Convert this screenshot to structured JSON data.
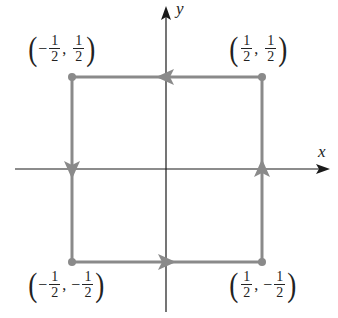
{
  "diagram": {
    "type": "square-contour",
    "axes": {
      "x_label": "x",
      "y_label": "y",
      "color": "#1a1a1a"
    },
    "path": {
      "color": "#8a8a8a",
      "direction": "counterclockwise",
      "arrows": [
        "top-left",
        "left-down",
        "bottom-right",
        "right-up"
      ]
    },
    "vertices": [
      {
        "id": "top-left",
        "label_parts": [
          "-",
          "1",
          "2",
          "",
          "1",
          "2"
        ],
        "x": -0.5,
        "y": 0.5
      },
      {
        "id": "top-right",
        "label_parts": [
          "",
          "1",
          "2",
          "",
          "1",
          "2"
        ],
        "x": 0.5,
        "y": 0.5
      },
      {
        "id": "bottom-left",
        "label_parts": [
          "-",
          "1",
          "2",
          "-",
          "1",
          "2"
        ],
        "x": -0.5,
        "y": -0.5
      },
      {
        "id": "bottom-right",
        "label_parts": [
          "",
          "1",
          "2",
          "-",
          "1",
          "2"
        ],
        "x": 0.5,
        "y": -0.5
      }
    ],
    "labels": {
      "tl": {
        "open": "(",
        "sign1": "−",
        "num1": "1",
        "den1": "2",
        "comma": ",",
        "sign2": "",
        "num2": "1",
        "den2": "2",
        "close": ")"
      },
      "tr": {
        "open": "(",
        "sign1": "",
        "num1": "1",
        "den1": "2",
        "comma": ",",
        "sign2": "",
        "num2": "1",
        "den2": "2",
        "close": ")"
      },
      "bl": {
        "open": "(",
        "sign1": "−",
        "num1": "1",
        "den1": "2",
        "comma": ",",
        "sign2": "−",
        "num2": "1",
        "den2": "2",
        "close": ")"
      },
      "br": {
        "open": "(",
        "sign1": "",
        "num1": "1",
        "den1": "2",
        "comma": ",",
        "sign2": "−",
        "num2": "1",
        "den2": "2",
        "close": ")"
      }
    }
  }
}
